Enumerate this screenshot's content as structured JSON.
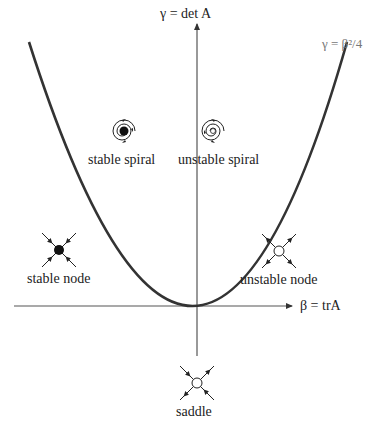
{
  "diagram": {
    "axes": {
      "x_label": "β = trA",
      "y_label": "γ = det A"
    },
    "curve": {
      "label": "γ = β²/4",
      "color": "#333333"
    },
    "regions": [
      {
        "id": "stable-spiral",
        "label": "stable spiral",
        "center_style": "filled-spiral-inward"
      },
      {
        "id": "unstable-spiral",
        "label": "unstable spiral",
        "center_style": "open-spiral-outward"
      },
      {
        "id": "stable-node",
        "label": "stable node",
        "center_style": "filled-dot-arrows-in"
      },
      {
        "id": "unstable-node",
        "label": "unstable node",
        "center_style": "open-circle-arrows-out"
      },
      {
        "id": "saddle",
        "label": "saddle",
        "center_style": "open-circle-mixed-arrows"
      }
    ],
    "colors": {
      "axis": "#555555",
      "curve": "#333333",
      "text": "#222222",
      "curve_label": "#777777"
    }
  }
}
